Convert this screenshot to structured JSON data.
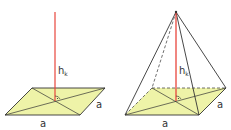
{
  "figures": [
    {
      "name": "square-base-with-height",
      "labels": {
        "height": "h",
        "height_sub": "k",
        "side_front": "a",
        "side_right": "a"
      }
    },
    {
      "name": "square-pyramid",
      "labels": {
        "height": "h",
        "height_sub": "k",
        "side_front": "a",
        "side_right": "a"
      }
    }
  ],
  "colors": {
    "base_fill": "#eef3a8",
    "edge": "#333333",
    "height_line": "#e8453c"
  }
}
